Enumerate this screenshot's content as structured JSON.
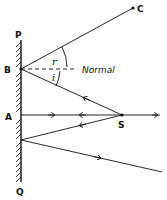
{
  "diagram": {
    "type": "plane-mirror-reflection",
    "colors": {
      "ink": "#111111",
      "background": "#ffffff"
    },
    "labels": {
      "mirror_top": "P",
      "mirror_bottom": "Q",
      "point_b": "B",
      "point_a": "A",
      "point_c": "C",
      "source": "S",
      "angle_reflection": "r",
      "angle_incidence": "i",
      "normal": "Normal"
    },
    "points": {
      "P": [
        21,
        40
      ],
      "Q": [
        21,
        182
      ],
      "B": [
        21,
        69
      ],
      "A": [
        21,
        115
      ],
      "C": [
        133,
        8
      ],
      "S": [
        122,
        115
      ],
      "R3": [
        21,
        140
      ]
    },
    "rays": [
      {
        "from": "S",
        "to": "B",
        "arrow": "toward-mirror"
      },
      {
        "from": "B",
        "to": "C",
        "arrow": "outward"
      },
      {
        "from": "S",
        "to": "A",
        "arrow": "toward-mirror"
      },
      {
        "from": "A",
        "to": "S",
        "arrow": "outward"
      },
      {
        "from": "S",
        "to": "R3",
        "arrow": "toward-mirror"
      },
      {
        "from": "R3",
        "to": "end",
        "arrow": "outward"
      },
      {
        "from": "S",
        "to": "right-edge",
        "arrow": "outward"
      }
    ]
  }
}
